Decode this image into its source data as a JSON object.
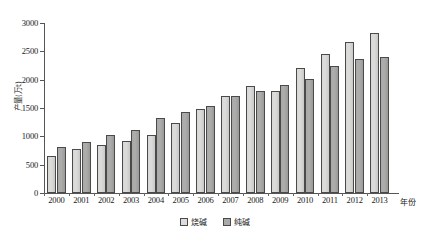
{
  "chart_data": {
    "type": "bar",
    "title": "",
    "xlabel": "年份",
    "ylabel": "产量(万t)",
    "categories": [
      "2000",
      "2001",
      "2002",
      "2003",
      "2004",
      "2005",
      "2006",
      "2007",
      "2008",
      "2009",
      "2010",
      "2011",
      "2012",
      "2013"
    ],
    "series": [
      {
        "name": "烧碱",
        "color": "#dcdcda",
        "values": [
          655,
          775,
          855,
          920,
          1025,
          1240,
          1490,
          1715,
          1890,
          1805,
          2205,
          2445,
          2665,
          2820
        ]
      },
      {
        "name": "纯碱",
        "color": "#a9a9a7",
        "values": [
          820,
          905,
          1020,
          1120,
          1320,
          1425,
          1540,
          1720,
          1805,
          1905,
          2010,
          2250,
          2370,
          2400
        ]
      }
    ],
    "ylim": [
      0,
      3000
    ],
    "yticks": [
      0,
      500,
      1000,
      1500,
      2000,
      2500,
      3000
    ],
    "ytick_labels": [
      "0",
      "500",
      "1000",
      "1500",
      "2000",
      "2500",
      "3000"
    ],
    "grid": false,
    "legend_position": "bottom-center"
  }
}
